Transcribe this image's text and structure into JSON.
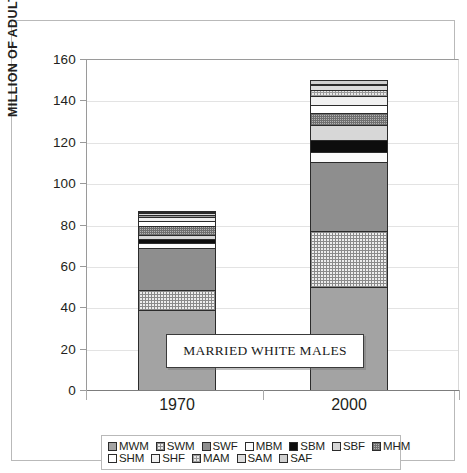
{
  "chart_data": {
    "type": "bar",
    "stacked": true,
    "title": "",
    "xlabel": "",
    "ylabel": "MILLION OF ADULTS",
    "categories": [
      "1970",
      "2000"
    ],
    "ylim": [
      0,
      160
    ],
    "ytick_step": 20,
    "yticks": [
      "0",
      "20",
      "40",
      "60",
      "80",
      "100",
      "120",
      "140",
      "160"
    ],
    "grid": true,
    "legend_position": "bottom",
    "annotations": [
      {
        "text": "MARRIED WHITE MALES",
        "points_to": "MWM segment of 1970 bar"
      }
    ],
    "series": [
      {
        "name": "MWM",
        "label": "MWM",
        "pattern": "solid-medium-gray",
        "values": [
          38.5,
          50.0
        ]
      },
      {
        "name": "SWM",
        "label": "SWM",
        "pattern": "fine-grid-light",
        "values": [
          10.0,
          27.0
        ]
      },
      {
        "name": "SWF",
        "label": "SWF",
        "pattern": "solid-dark-gray",
        "values": [
          20.0,
          33.0
        ]
      },
      {
        "name": "MBM",
        "label": "MBM",
        "pattern": "white",
        "values": [
          2.5,
          5.0
        ]
      },
      {
        "name": "SBM",
        "label": "SBM",
        "pattern": "solid-black",
        "values": [
          2.0,
          6.0
        ]
      },
      {
        "name": "SBF",
        "label": "SBF",
        "pattern": "light-gray",
        "values": [
          2.0,
          7.0
        ]
      },
      {
        "name": "MHM",
        "label": "MHM",
        "pattern": "dense-grid-gray",
        "values": [
          4.5,
          6.0
        ]
      },
      {
        "name": "SHM",
        "label": "SHM",
        "pattern": "white",
        "values": [
          2.0,
          4.0
        ]
      },
      {
        "name": "SHF",
        "label": "SHF",
        "pattern": "near-white",
        "values": [
          2.0,
          4.0
        ]
      },
      {
        "name": "MAM",
        "label": "MAM",
        "pattern": "grid-light",
        "values": [
          1.0,
          3.0
        ]
      },
      {
        "name": "SAM",
        "label": "SAM",
        "pattern": "pale-gray",
        "values": [
          1.0,
          2.5
        ]
      },
      {
        "name": "SAF",
        "label": "SAF",
        "pattern": "pale-gray-2",
        "values": [
          1.0,
          2.5
        ]
      }
    ],
    "totals": [
      87.5,
      150.0
    ]
  },
  "legend": {
    "row1": [
      "MWM",
      "SWM",
      "SWF",
      "MBM",
      "SBM",
      "SBF",
      "MHM"
    ],
    "row2": [
      "SHM",
      "SHF",
      "MAM",
      "SAM",
      "SAF"
    ]
  },
  "callout": {
    "text": "MARRIED WHITE MALES"
  }
}
